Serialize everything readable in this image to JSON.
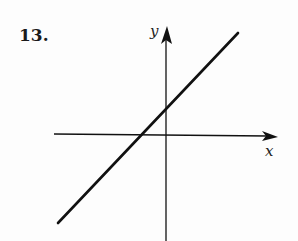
{
  "problem": {
    "number": "13."
  },
  "axes": {
    "x_label": "x",
    "y_label": "y"
  },
  "colors": {
    "ink": "#111111",
    "background": "#fdfdfd"
  },
  "graph": {
    "type": "line",
    "description": "Straight line with positive slope, x-intercept negative, y-intercept positive",
    "x_intercept_sign": "negative",
    "y_intercept_sign": "positive",
    "slope_sign": "positive"
  }
}
